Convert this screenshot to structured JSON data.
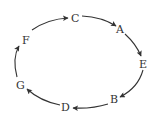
{
  "diagram": {
    "type": "directed-cycle",
    "nodes": [
      {
        "id": "C",
        "label": "C",
        "x": 76,
        "y": 18
      },
      {
        "id": "A",
        "label": "A",
        "x": 121,
        "y": 29
      },
      {
        "id": "E",
        "label": "E",
        "x": 143,
        "y": 64
      },
      {
        "id": "B",
        "label": "B",
        "x": 114,
        "y": 99
      },
      {
        "id": "D",
        "label": "D",
        "x": 66,
        "y": 107
      },
      {
        "id": "G",
        "label": "G",
        "x": 21,
        "y": 85
      },
      {
        "id": "F",
        "label": "F",
        "x": 26,
        "y": 40
      }
    ],
    "edges": [
      {
        "from": "C",
        "to": "A"
      },
      {
        "from": "A",
        "to": "E"
      },
      {
        "from": "E",
        "to": "B"
      },
      {
        "from": "B",
        "to": "D"
      },
      {
        "from": "D",
        "to": "G"
      },
      {
        "from": "G",
        "to": "F"
      },
      {
        "from": "F",
        "to": "C"
      }
    ],
    "colors": {
      "stroke": "#333333",
      "text": "#333333"
    }
  }
}
